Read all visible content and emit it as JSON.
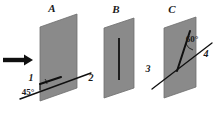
{
  "figure": {
    "type": "physics-optics-diagram",
    "background_color": "#ffffff",
    "panel_fill": "#8a8a8a",
    "panel_stroke": "#6f6f6f",
    "line_color": "#101010"
  },
  "panels": [
    {
      "id": "A",
      "letter": "A",
      "letter_pos": {
        "x": 52,
        "y": 12
      },
      "feature": "diagonal line through plate at 45 degrees",
      "labels": [
        {
          "name": "ray-1",
          "text": "1",
          "x": 31,
          "y": 81
        },
        {
          "name": "ray-2",
          "text": "2",
          "x": 91,
          "y": 81
        },
        {
          "name": "angle-45",
          "text": "45°",
          "x": 26,
          "y": 94
        }
      ]
    },
    {
      "id": "B",
      "letter": "B",
      "letter_pos": {
        "x": 116,
        "y": 13
      },
      "feature": "vertical line through middle of plate",
      "labels": [
        {
          "name": "ray-3",
          "text": "3",
          "x": 148,
          "y": 72
        }
      ]
    },
    {
      "id": "C",
      "letter": "C",
      "letter_pos": {
        "x": 172,
        "y": 13
      },
      "feature": "two lines meeting at a vertex forming a 60 degree angle",
      "labels": [
        {
          "name": "angle-60",
          "text": "60°",
          "x": 188,
          "y": 40
        },
        {
          "name": "ray-4",
          "text": "4",
          "x": 206,
          "y": 55
        }
      ]
    }
  ],
  "arrow": {
    "name": "incoming-ray-arrow",
    "direction": "right",
    "color": "#101010",
    "from": {
      "x": 3,
      "y": 60
    },
    "to": {
      "x": 31,
      "y": 60
    }
  },
  "angles": {
    "panel_a": "45°",
    "panel_c": "60°"
  },
  "ray_numbers": [
    "1",
    "2",
    "3",
    "4"
  ],
  "panel_letters": [
    "A",
    "B",
    "C"
  ]
}
